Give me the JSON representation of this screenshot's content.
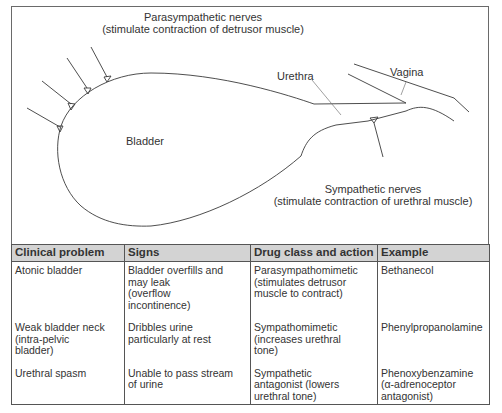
{
  "diagram": {
    "labels": {
      "parasympathetic_title": "Parasympathetic nerves",
      "parasympathetic_sub": "(stimulate contraction of detrusor muscle)",
      "urethra": "Urethra",
      "vagina": "Vagina",
      "bladder": "Bladder",
      "sympathetic_title": "Sympathetic nerves",
      "sympathetic_sub": "(stimulate contraction of urethral muscle)"
    },
    "colors": {
      "line": "#3a3a3a",
      "border": "#6a6a6a",
      "header_bg": "#d3d3d3"
    }
  },
  "table": {
    "headers": [
      "Clinical problem",
      "Signs",
      "Drug class and action",
      "Example"
    ],
    "rows": [
      {
        "problem": [
          "Atonic bladder"
        ],
        "signs": [
          "Bladder overfills and",
          "may leak",
          "(overflow",
          "incontinence)"
        ],
        "drug": [
          "Parasympathomimetic",
          "(stimulates detrusor",
          "muscle to contract)"
        ],
        "example": [
          "Bethanecol"
        ]
      },
      {
        "problem": [
          "Weak bladder neck",
          "(intra-pelvic",
          "bladder)"
        ],
        "signs": [
          "Dribbles urine",
          "particularly at rest"
        ],
        "drug": [
          "Sympathomimetic",
          "(increases urethral",
          "tone)"
        ],
        "example": [
          "Phenylpropanolamine"
        ]
      },
      {
        "problem": [
          "Urethral spasm"
        ],
        "signs": [
          "Unable to pass stream",
          "of urine"
        ],
        "drug": [
          "Sympathetic",
          "antagonist (lowers",
          "urethral tone)"
        ],
        "example": [
          "Phenoxybenzamine",
          "(α-adrenoceptor",
          "antagonist)"
        ]
      }
    ]
  }
}
